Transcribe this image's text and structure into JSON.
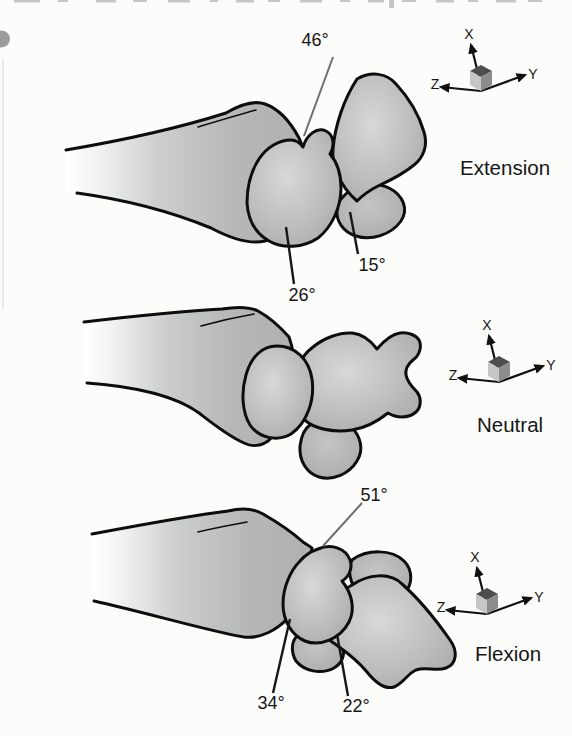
{
  "panels": [
    {
      "name": "Extension",
      "angles": [
        {
          "value": "46°",
          "points_to": "radiolunate joint, dorsal"
        },
        {
          "value": "26°",
          "points_to": "lunate, volar edge"
        },
        {
          "value": "15°",
          "points_to": "capitolunate joint"
        }
      ]
    },
    {
      "name": "Neutral",
      "angles": []
    },
    {
      "name": "Flexion",
      "angles": [
        {
          "value": "51°",
          "points_to": "radiolunate joint, dorsal"
        },
        {
          "value": "34°",
          "points_to": "radiolunate joint, volar"
        },
        {
          "value": "22°",
          "points_to": "capitolunate joint"
        }
      ]
    }
  ],
  "axes": {
    "x": "X",
    "y": "Y",
    "z": "Z"
  },
  "colors": {
    "background": "#fcfcfb",
    "bone_fill": "#b3b5b5",
    "bone_highlight": "#d7d9d9",
    "outline": "#0d0d0d",
    "leader_gray": "#6e6e6e",
    "text": "#161616"
  }
}
